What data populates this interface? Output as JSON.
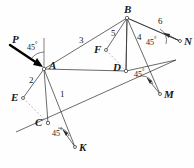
{
  "figure": {
    "stroke_color": "#2b2b2b",
    "dashed_color": "#8a8a8a",
    "force_color": "#000000",
    "background": "#fefefe",
    "points": [
      {
        "id": "A",
        "label": "A",
        "x": 44,
        "y": 69,
        "label_dx": 5,
        "label_dy": -9
      },
      {
        "id": "B",
        "label": "B",
        "x": 127,
        "y": 18,
        "label_dx": -3,
        "label_dy": -14
      },
      {
        "id": "C",
        "label": "C",
        "x": 48,
        "y": 123,
        "label_dx": -13,
        "label_dy": -6
      },
      {
        "id": "D",
        "label": "D",
        "x": 126,
        "y": 71,
        "label_dx": -13,
        "label_dy": -9
      },
      {
        "id": "E",
        "label": "E",
        "x": 23,
        "y": 98,
        "label_dx": -12,
        "label_dy": -6
      },
      {
        "id": "F",
        "label": "F",
        "x": 106,
        "y": 50,
        "label_dx": -12,
        "label_dy": -6
      },
      {
        "id": "K",
        "label": "K",
        "x": 75,
        "y": 147,
        "label_dx": 4,
        "label_dy": -5
      },
      {
        "id": "M",
        "label": "M",
        "x": 160,
        "y": 94,
        "label_dx": 4,
        "label_dy": -5
      },
      {
        "id": "N",
        "label": "N",
        "x": 180,
        "y": 41,
        "label_dx": 4,
        "label_dy": -5
      }
    ],
    "members": [
      {
        "name": "member-3-A-B",
        "from": "A",
        "to": "B"
      },
      {
        "name": "member-1-A-C",
        "from": "A",
        "to": "C"
      },
      {
        "name": "member-2-A-E",
        "from": "A",
        "to": "E"
      },
      {
        "name": "member-5-B-F",
        "from": "B",
        "to": "F"
      },
      {
        "name": "member-4-B-D",
        "from": "B",
        "to": "D"
      },
      {
        "name": "member-6-B-N",
        "from": "B",
        "to": "N"
      },
      {
        "name": "member-A-D-rail",
        "from": "A",
        "to": "D"
      }
    ],
    "member_labels": [
      {
        "id": "1",
        "text": "1",
        "x": 60,
        "y": 95
      },
      {
        "id": "2",
        "text": "2",
        "x": 30,
        "y": 80
      },
      {
        "id": "3",
        "text": "3",
        "x": 80,
        "y": 40
      },
      {
        "id": "4",
        "text": "4",
        "x": 138,
        "y": 38
      },
      {
        "id": "5",
        "text": "5",
        "x": 112,
        "y": 33
      },
      {
        "id": "6",
        "text": "6",
        "x": 159,
        "y": 21
      }
    ],
    "angle_labels": [
      {
        "id": "angle-at-A",
        "text": "45",
        "degree": "°",
        "x": 28,
        "y": 45
      },
      {
        "id": "angle-at-N",
        "text": "45",
        "degree": "°",
        "x": 148,
        "y": 39
      },
      {
        "id": "angle-at-M",
        "text": "45",
        "degree": "°",
        "x": 134,
        "y": 73
      },
      {
        "id": "angle-at-K",
        "text": "45",
        "degree": "°",
        "x": 52,
        "y": 131
      }
    ],
    "force_label": {
      "id": "force-P",
      "text": "P",
      "x": 13,
      "y": 40
    },
    "force_arrow": {
      "name": "force-P-arrow",
      "tail_x": 10,
      "tail_y": 45,
      "head_x": 43,
      "head_y": 67
    }
  }
}
